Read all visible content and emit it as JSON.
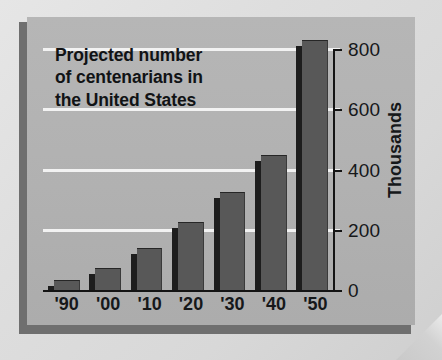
{
  "chart_data": {
    "type": "bar",
    "title": "Projected number\nof centenarians in\nthe United States",
    "title_lines": [
      "Projected number",
      "of centenarians in",
      "the United States"
    ],
    "xlabel": "",
    "ylabel": "Thousands",
    "categories": [
      "'90",
      "'00",
      "'10",
      "'20",
      "'30",
      "'40",
      "'50"
    ],
    "values": [
      32,
      72,
      139,
      226,
      324,
      448,
      830
    ],
    "ylim": [
      0,
      880
    ],
    "ytick_values": [
      0,
      200,
      400,
      600,
      800
    ],
    "ytick_labels": [
      "0",
      "200",
      "400",
      "600",
      "800"
    ],
    "gridlines": true,
    "gridline_values": [
      200,
      400,
      600,
      800
    ],
    "legend": null,
    "series": [
      {
        "name": "Projected centenarians",
        "values": [
          32,
          72,
          139,
          226,
          324,
          448,
          830
        ]
      }
    ],
    "colors": {
      "bar_fill": "#585858",
      "bar_shadow": "#1d1d1d",
      "panel_background": "#b1b1b1",
      "page_background": "#dcdcdc",
      "frame": "#6f6f6f",
      "gridline": "#f2f2f2",
      "axis": "#141414",
      "text": "#16181a"
    }
  }
}
